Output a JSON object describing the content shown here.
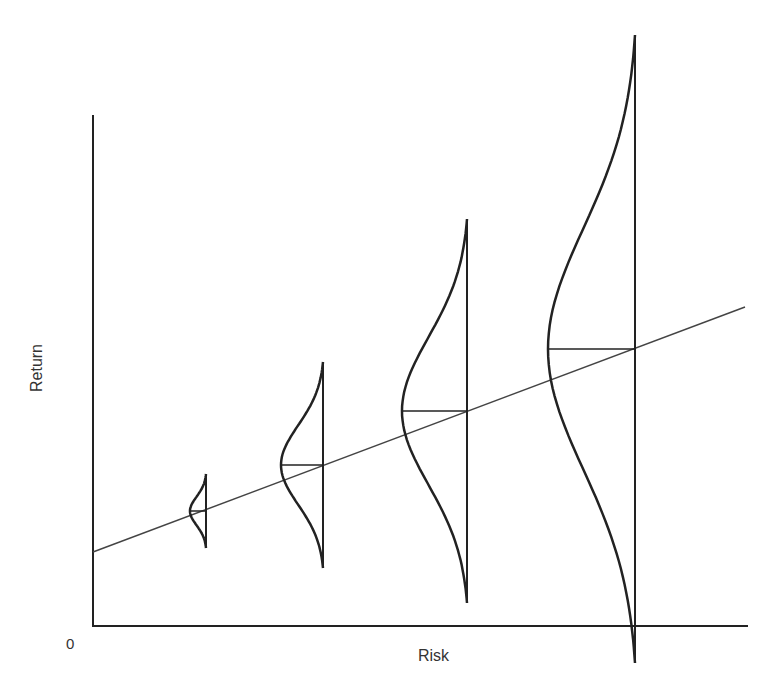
{
  "chart_data": {
    "type": "diagram",
    "title": "",
    "xlabel": "Risk",
    "ylabel": "Return",
    "origin_label": "0",
    "grid": false,
    "legend": null,
    "axes": {
      "y_axis": {
        "x": 93,
        "y_top": 115,
        "y_bottom": 626
      },
      "x_axis": {
        "y": 626,
        "x_left": 93,
        "x_right": 748
      }
    },
    "trend_line": {
      "x1": 93,
      "y1": 552,
      "x2": 745,
      "y2": 307,
      "description": "linear risk-return relationship"
    },
    "distributions": [
      {
        "name": "distribution-1",
        "x": 206,
        "mean_y": 511,
        "top_y": 474,
        "bottom_y": 548,
        "peak_x": 190,
        "relative_spread": 1
      },
      {
        "name": "distribution-2",
        "x": 323,
        "mean_y": 465,
        "top_y": 362,
        "bottom_y": 568,
        "peak_x": 281,
        "relative_spread": 2.8
      },
      {
        "name": "distribution-3",
        "x": 467,
        "mean_y": 411,
        "top_y": 219,
        "bottom_y": 603,
        "peak_x": 402,
        "relative_spread": 5.2
      },
      {
        "name": "distribution-4",
        "x": 635,
        "mean_y": 349,
        "top_y": 35,
        "bottom_y": 663,
        "peak_x": 548,
        "relative_spread": 8.5
      }
    ],
    "colors": {
      "axis": "#222222",
      "curve": "#222222",
      "trend": "#444444",
      "text": "#333333"
    }
  }
}
